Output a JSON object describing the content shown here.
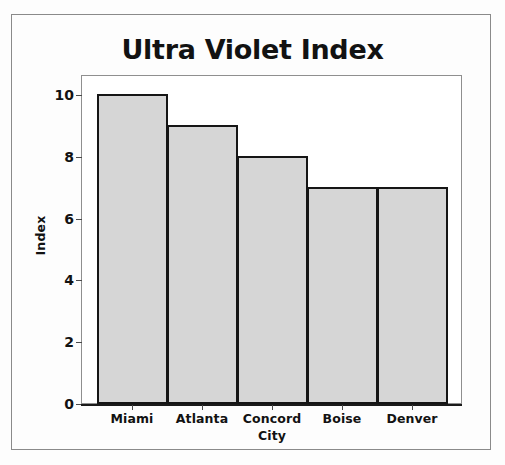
{
  "chart_data": {
    "type": "bar",
    "title": "Ultra Violet Index",
    "xlabel": "",
    "ylabel": "Index",
    "categories": [
      "Miami",
      "Atlanta",
      "Concord City",
      "Boise",
      "Denver"
    ],
    "values": [
      10,
      9,
      8,
      7,
      7
    ],
    "ylim": [
      0,
      10.6
    ],
    "yticks": [
      "0",
      "2",
      "4",
      "6",
      "8",
      "10"
    ],
    "ytick_values": [
      0,
      2,
      4,
      6,
      8,
      10
    ],
    "grid": false,
    "legend": null,
    "series": [
      {
        "name": "Index",
        "values": [
          10,
          9,
          8,
          7,
          7
        ]
      }
    ],
    "style": {
      "bar_fill": "#d6d6d6",
      "bar_edge": "#151515",
      "text_color": "#121212",
      "plot_background": "#ffffff",
      "figure_background": "#fdfdfd",
      "frame_color": "#8a8a8a"
    }
  },
  "axis": {
    "y_label": "Index",
    "ticks": [
      {
        "label": "10",
        "value": 10
      },
      {
        "label": "8",
        "value": 8
      },
      {
        "label": "6",
        "value": 6
      },
      {
        "label": "4",
        "value": 4
      },
      {
        "label": "2",
        "value": 2
      },
      {
        "label": "0",
        "value": 0
      }
    ]
  },
  "categories": [
    {
      "line1": "Miami",
      "line2": ""
    },
    {
      "line1": "Atlanta",
      "line2": ""
    },
    {
      "line1": "Concord",
      "line2": "City"
    },
    {
      "line1": "Boise",
      "line2": ""
    },
    {
      "line1": "Denver",
      "line2": ""
    }
  ]
}
